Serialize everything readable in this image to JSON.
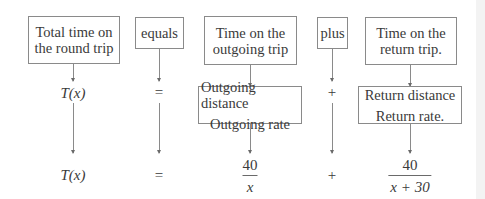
{
  "diagram": {
    "top_boxes": [
      {
        "id": "total",
        "line1": "Total time on",
        "line2": "the round trip"
      },
      {
        "id": "equals",
        "label": "equals"
      },
      {
        "id": "outgoing",
        "line1": "Time on the",
        "line2": "outgoing trip"
      },
      {
        "id": "plus",
        "label": "plus"
      },
      {
        "id": "return",
        "line1": "Time on the",
        "line2": "return trip."
      }
    ],
    "middle_row": {
      "total": "T(x)",
      "equals": "=",
      "outgoing_fraction": {
        "numerator": "Outgoing distance",
        "denominator": "Outgoing rate"
      },
      "plus": "+",
      "return_fraction": {
        "numerator": "Return distance",
        "denominator": "Return rate."
      }
    },
    "bottom_row": {
      "total": "T(x)",
      "equals": "=",
      "outgoing_fraction": {
        "numerator": "40",
        "denominator": "x"
      },
      "plus": "+",
      "return_fraction": {
        "numerator": "40",
        "denominator": "x + 30"
      }
    }
  }
}
